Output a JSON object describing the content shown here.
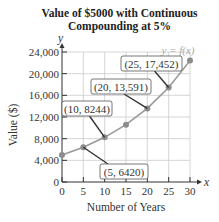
{
  "chart_data": {
    "type": "line",
    "title_lines": [
      "Value of $5000 with Continuous",
      "Compounding at 5%"
    ],
    "xlabel": "Number of Years",
    "ylabel": "Value ($)",
    "x_axis_letter": "x",
    "y_axis_letter": "y",
    "xlim": [
      0,
      30
    ],
    "ylim": [
      0,
      24000
    ],
    "grid": true,
    "x_ticks": [
      "0",
      "5",
      "10",
      "15",
      "20",
      "25",
      "30"
    ],
    "y_ticks": [
      "0",
      "4,000",
      "8,000",
      "12,000",
      "16,000",
      "20,000",
      "24,000"
    ],
    "series": [
      {
        "name": "y = f(x)",
        "x": [
          0,
          5,
          10,
          15,
          20,
          25,
          30
        ],
        "values": [
          5000,
          6420,
          8244,
          10585,
          13591,
          17452,
          22408
        ]
      }
    ],
    "curve_label": "y = f(x)",
    "annotations": [
      {
        "text": "(5, 6420)",
        "x": 5,
        "y": 6420
      },
      {
        "text": "(10, 8244)",
        "x": 10,
        "y": 8244
      },
      {
        "text": "(20, 13,591)",
        "x": 20,
        "y": 13591
      },
      {
        "text": "(25, 17,452)",
        "x": 25,
        "y": 17452
      }
    ],
    "colors": {
      "line": "#999999",
      "points": "#8c8c8c",
      "grid": "#cccccc",
      "axis": "#333333"
    }
  }
}
